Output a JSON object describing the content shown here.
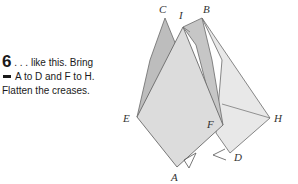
{
  "instruction": {
    "step_number": "6",
    "line1": ". . . like this. Bring",
    "line2": "A to D and F to H.",
    "line3": "Flatten the creases."
  },
  "diagram": {
    "labels": {
      "C": "C",
      "I": "I",
      "B": "B",
      "E": "E",
      "F": "F",
      "H": "H",
      "A": "A",
      "D": "D"
    },
    "colors": {
      "paper_light": "#e4e4e4",
      "paper_mid": "#d2d2d2",
      "paper_dark": "#bdbdbd",
      "stroke": "#6a6a6a"
    }
  }
}
